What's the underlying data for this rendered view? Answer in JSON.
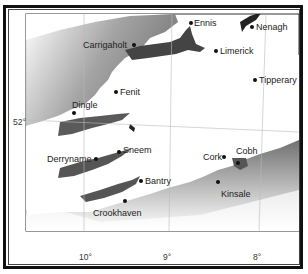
{
  "map": {
    "region": "Southwest Ireland",
    "places": [
      {
        "name": "Ennis",
        "x": 191,
        "y": 23,
        "lx": 194,
        "ly": 19
      },
      {
        "name": "Nenagh",
        "x": 252,
        "y": 27,
        "lx": 256,
        "ly": 23
      },
      {
        "name": "Carrigaholt",
        "x": 134,
        "y": 45,
        "lx": 83,
        "ly": 41
      },
      {
        "name": "Limerick",
        "x": 216,
        "y": 51,
        "lx": 220,
        "ly": 47
      },
      {
        "name": "Tipperary",
        "x": 255,
        "y": 80,
        "lx": 259,
        "ly": 76
      },
      {
        "name": "Fenit",
        "x": 116,
        "y": 92,
        "lx": 120,
        "ly": 88
      },
      {
        "name": "Dingle",
        "x": 74,
        "y": 113,
        "lx": 72,
        "ly": 101
      },
      {
        "name": "Sneem",
        "x": 119,
        "y": 152,
        "lx": 123,
        "ly": 146
      },
      {
        "name": "Derryname",
        "x": 96,
        "y": 159,
        "lx": 47,
        "ly": 155
      },
      {
        "name": "Cork",
        "x": 224,
        "y": 157,
        "lx": 203,
        "ly": 153
      },
      {
        "name": "Cobh",
        "x": 238,
        "y": 163,
        "lx": 236,
        "ly": 147
      },
      {
        "name": "Bantry",
        "x": 141,
        "y": 181,
        "lx": 145,
        "ly": 177
      },
      {
        "name": "Kinsale",
        "x": 218,
        "y": 182,
        "lx": 221,
        "ly": 190
      },
      {
        "name": "Crookhaven",
        "x": 125,
        "y": 201,
        "lx": 93,
        "ly": 209
      }
    ],
    "latitude_ticks": [
      {
        "label": "52°",
        "y": 123
      }
    ],
    "longitude_ticks": [
      {
        "label": "10°",
        "x": 85
      },
      {
        "label": "9°",
        "x": 169
      },
      {
        "label": "8°",
        "x": 259
      }
    ],
    "colors": {
      "land": "#ffffff",
      "sea_dark": "#555555",
      "sea_light": "#ffffff",
      "frame": "#111111"
    }
  }
}
